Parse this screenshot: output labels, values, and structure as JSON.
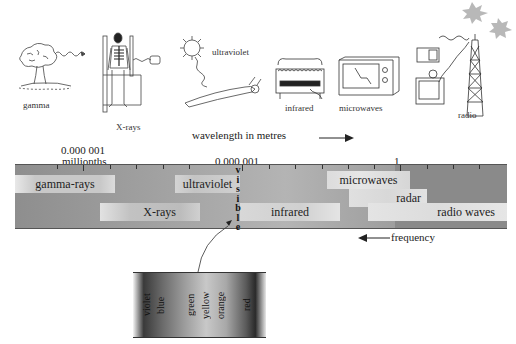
{
  "illustrations": [
    {
      "id": "gamma",
      "label": "gamma",
      "depicts": "mushroom cloud (nuclear explosion)"
    },
    {
      "id": "xrays",
      "label": "X-rays",
      "depicts": "person in X-ray machine showing skeleton"
    },
    {
      "id": "ultraviolet",
      "label": "ultraviolet",
      "depicts": "sun and sunbathing person"
    },
    {
      "id": "infrared",
      "label": "infrared",
      "depicts": "electric heater"
    },
    {
      "id": "microwaves",
      "label": "microwaves",
      "depicts": "microwave oven"
    },
    {
      "id": "radio",
      "label": "radio",
      "depicts": "radio, television and transmitter tower"
    }
  ],
  "axis": {
    "wavelength_label": "wavelength in metres",
    "wavelength_arrow": "→",
    "frequency_label": "frequency",
    "frequency_arrow": "←",
    "ticks": [
      {
        "value": "0.000 001",
        "sub": "millionths"
      },
      {
        "value": "0.000 001",
        "sub": ""
      },
      {
        "value": "1",
        "sub": ""
      }
    ]
  },
  "spectrum_bands": [
    {
      "name": "gamma-rays",
      "row": 1
    },
    {
      "name": "ultraviolet",
      "row": 1
    },
    {
      "name": "microwaves",
      "row": 1
    },
    {
      "name": "radar",
      "row": 2
    },
    {
      "name": "X-rays",
      "row": 3
    },
    {
      "name": "infrared",
      "row": 3
    },
    {
      "name": "radio waves",
      "row": 3
    }
  ],
  "visible": {
    "vertical_label": "visible",
    "letters": [
      "v",
      "i",
      "s",
      "i",
      "b",
      "l",
      "e"
    ],
    "colours": [
      "violet",
      "blue",
      "green",
      "yellow",
      "orange",
      "red"
    ]
  }
}
